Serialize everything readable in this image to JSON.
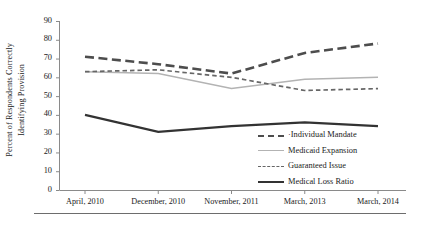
{
  "chart_data": {
    "type": "line",
    "title": "",
    "xlabel": "",
    "ylabel": "Percent of Respondents Correctly Identifying Provision",
    "ylabel_line1": "Percent of Respondents Correctly",
    "ylabel_line2": "Identifying Provision",
    "categories": [
      "April, 2010",
      "December, 2010",
      "November, 2011",
      "March, 2013",
      "March, 2014"
    ],
    "ylim": [
      0,
      90
    ],
    "yticks": [
      0,
      10,
      20,
      30,
      40,
      50,
      60,
      70,
      80,
      90
    ],
    "grid": false,
    "legend_position": "inside-bottom-right",
    "series": [
      {
        "name": "Individual Mandate",
        "values": [
          71,
          67,
          62,
          73,
          78
        ],
        "color": "#4d4d4d",
        "style": "dashed-thick",
        "legend_label": "·Individual Mandate"
      },
      {
        "name": "Medicaid Expansion",
        "values": [
          63,
          62,
          54,
          59,
          60
        ],
        "color": "#b3b3b3",
        "style": "solid-thin",
        "legend_label": "Medicaid Expansion"
      },
      {
        "name": "Guaranteed Issue",
        "values": [
          63,
          64,
          60,
          53,
          54
        ],
        "color": "#666666",
        "style": "dashed-thin",
        "legend_label": "Guaranteed Issue"
      },
      {
        "name": "Medical Loss Ratio",
        "values": [
          40,
          31,
          34,
          36,
          34
        ],
        "color": "#333333",
        "style": "solid-thick",
        "legend_label": "Medical Loss Ratio"
      }
    ]
  },
  "axis": {
    "y_tick_labels": [
      "90",
      "80",
      "70",
      "60",
      "50",
      "40",
      "30",
      "20",
      "10",
      "0"
    ],
    "x_tick_labels": [
      "April, 2010",
      "December, 2010",
      "November, 2011",
      "March, 2013",
      "March, 2014"
    ]
  },
  "legend": {
    "items": [
      {
        "label": "·Individual Mandate"
      },
      {
        "label": "Medicaid Expansion"
      },
      {
        "label": "Guaranteed Issue"
      },
      {
        "label": "Medical Loss Ratio"
      }
    ]
  }
}
